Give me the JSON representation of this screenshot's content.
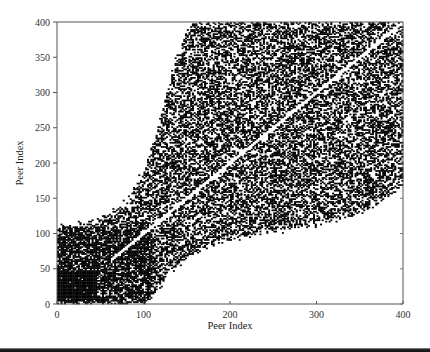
{
  "chart_data": {
    "type": "scatter",
    "title": "",
    "xlabel": "Peer Index",
    "ylabel": "Peer Index",
    "xlim": [
      0,
      400
    ],
    "ylim": [
      0,
      400
    ],
    "xticks": [
      0,
      100,
      200,
      300,
      400
    ],
    "yticks": [
      0,
      50,
      100,
      150,
      200,
      250,
      300,
      350,
      400
    ],
    "grid": false,
    "legend": "none",
    "marker_color": "#000000",
    "upper_boundary": {
      "x": [
        0,
        20,
        50,
        80,
        100,
        115,
        130,
        145,
        155,
        400
      ],
      "y": [
        105,
        112,
        118,
        145,
        190,
        245,
        320,
        375,
        400,
        400
      ]
    },
    "lower_boundary": {
      "x": [
        0,
        100,
        110,
        130,
        160,
        200,
        250,
        300,
        350,
        400
      ],
      "y": [
        0,
        0,
        10,
        45,
        75,
        92,
        102,
        112,
        130,
        165
      ]
    },
    "solid_core": {
      "x": [
        0,
        45
      ],
      "y": [
        0,
        45
      ]
    },
    "empty_diagonal": "y = x",
    "density": 0.5
  }
}
